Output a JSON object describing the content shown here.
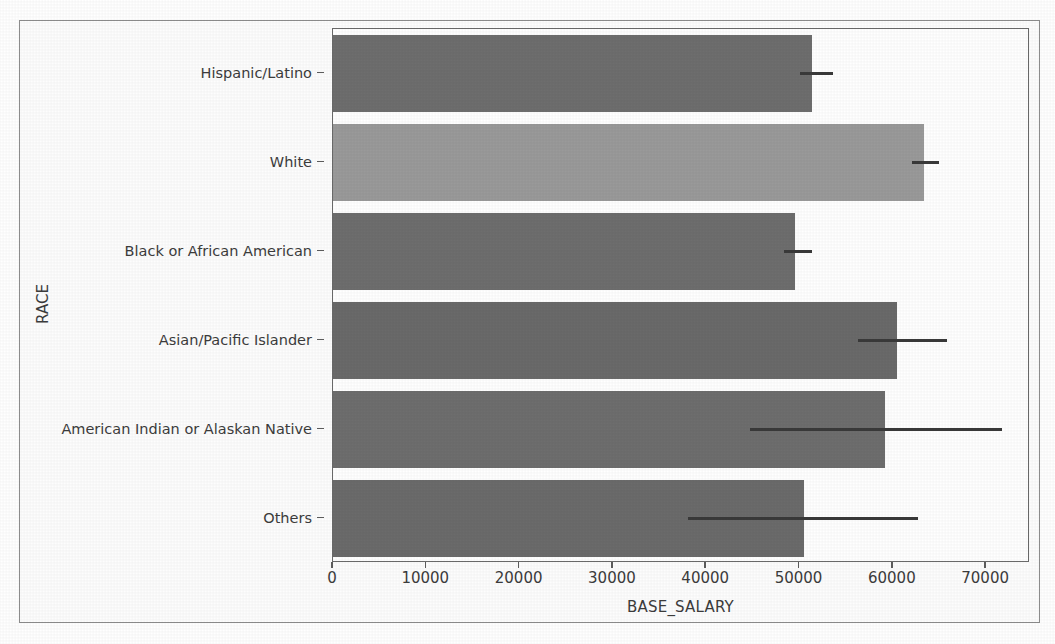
{
  "chart_data": {
    "type": "bar",
    "orientation": "horizontal",
    "title": "",
    "xlabel": "BASE_SALARY",
    "ylabel": "RACE",
    "categories": [
      "Hispanic/Latino",
      "White",
      "Black or African American",
      "Asian/Pacific Islander",
      "American Indian or Alaskan Native",
      "Others"
    ],
    "values": [
      51300,
      63300,
      49500,
      60400,
      59200,
      50500
    ],
    "error_low": [
      50100,
      62100,
      48300,
      56300,
      44700,
      38000
    ],
    "error_high": [
      53600,
      65000,
      51300,
      65800,
      71700,
      62700
    ],
    "bar_colors": [
      "#6e6e6e",
      "#9a9a9a",
      "#6e6e6e",
      "#6a6a6a",
      "#6e6e6e",
      "#6b6b6b"
    ],
    "error_color": "#3a3a3a",
    "xlim": [
      0,
      74700
    ],
    "xticks": [
      0,
      10000,
      20000,
      30000,
      40000,
      50000,
      60000,
      70000
    ],
    "xtick_labels": [
      "0",
      "10000",
      "20000",
      "30000",
      "40000",
      "50000",
      "60000",
      "70000"
    ],
    "grid": false,
    "legend": null
  }
}
